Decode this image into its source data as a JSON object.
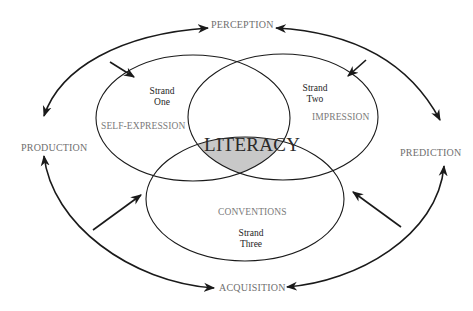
{
  "diagram": {
    "center_label": "LITERACY",
    "cycle_labels": {
      "top": "PERCEPTION",
      "left": "PRODUCTION",
      "right": "PREDICTION",
      "bottom": "ACQUISITION"
    },
    "strands": [
      {
        "name_line1": "Strand",
        "name_line2": "One",
        "concept": "SELF-EXPRESSION"
      },
      {
        "name_line1": "Strand",
        "name_line2": "Two",
        "concept": "IMPRESSION"
      },
      {
        "name_line1": "Strand",
        "name_line2": "Three",
        "concept": "CONVENTIONS"
      }
    ],
    "colors": {
      "line": "#1a1a1a",
      "intersection_fill": "#c8c8c8",
      "label_gray": "#707070"
    }
  }
}
